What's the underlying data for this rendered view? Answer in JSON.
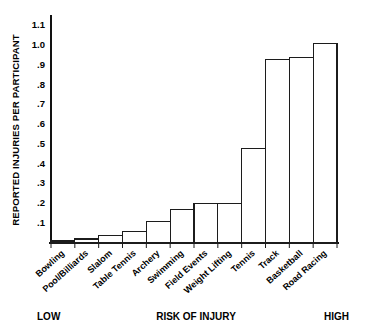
{
  "chart_data": {
    "type": "bar",
    "title": "",
    "xlabel": "RISK OF INJURY",
    "ylabel": "REPORTED INJURIES PER PARTICIPANT",
    "categories": [
      "Bowling",
      "Pool/Billiards",
      "Slalom",
      "Table Tennis",
      "Archery",
      "Swimming",
      "Field Events",
      "Weight Lifting",
      "Tennis",
      "Track",
      "Basketball",
      "Road Racing"
    ],
    "values": [
      0.01,
      0.02,
      0.04,
      0.06,
      0.11,
      0.17,
      0.2,
      0.2,
      0.48,
      0.93,
      0.94,
      1.01
    ],
    "ylim": [
      0,
      1.15
    ],
    "ytick_values": [
      0.1,
      0.2,
      0.3,
      0.4,
      0.5,
      0.6,
      0.7,
      0.8,
      0.9,
      1.0,
      1.1
    ],
    "ytick_labels": [
      ".1",
      ".2",
      ".3",
      ".4",
      ".5",
      ".6",
      ".7",
      ".8",
      ".9",
      "1.0",
      "1.1"
    ],
    "grid": false,
    "legend": "none",
    "bar_fill": "#ffffff",
    "bar_stroke": "#1c1c1c"
  },
  "footer": {
    "low": "LOW",
    "middle": "RISK OF INJURY",
    "high": "HIGH"
  }
}
